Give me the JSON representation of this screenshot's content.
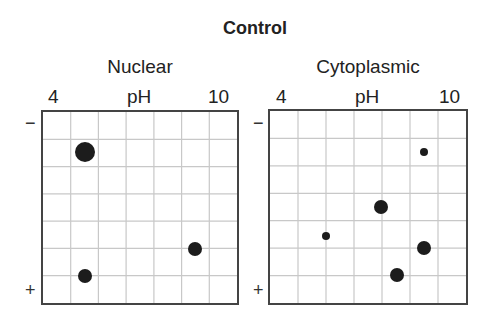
{
  "title": "Control",
  "panels": [
    {
      "name": "Nuclear",
      "axis": {
        "min_label": "4",
        "label": "pH",
        "max_label": "10"
      },
      "poles": {
        "top": "−",
        "bottom": "+"
      },
      "grid": {
        "cols": 7,
        "rows": 7
      },
      "spots": [
        {
          "ph": 5.3,
          "fy": 0.212,
          "size": "large"
        },
        {
          "ph": 5.3,
          "fy": 0.86,
          "size": "medium"
        },
        {
          "ph": 8.7,
          "fy": 0.715,
          "size": "medium"
        }
      ]
    },
    {
      "name": "Cytoplasmic",
      "axis": {
        "min_label": "4",
        "label": "pH",
        "max_label": "10"
      },
      "poles": {
        "top": "−",
        "bottom": "+"
      },
      "grid": {
        "cols": 7,
        "rows": 7
      },
      "spots": [
        {
          "ph": 8.7,
          "fy": 0.216,
          "size": "small"
        },
        {
          "ph": 7.4,
          "fy": 0.5,
          "size": "medium"
        },
        {
          "ph": 5.7,
          "fy": 0.649,
          "size": "small"
        },
        {
          "ph": 8.7,
          "fy": 0.711,
          "size": "medium"
        },
        {
          "ph": 7.9,
          "fy": 0.856,
          "size": "medium"
        }
      ]
    }
  ],
  "colors": {
    "spot": "#1c1c1c",
    "grid": "#c8c8c8",
    "border": "#444444"
  }
}
